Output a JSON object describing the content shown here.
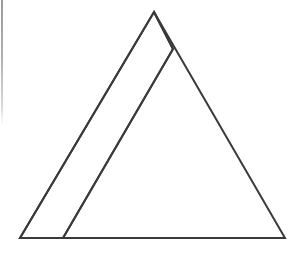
{
  "figure": {
    "canvas": {
      "width": 303,
      "height": 260,
      "background_color": "#ffffff"
    },
    "style": {
      "stroke_color": "#3a3a3a",
      "stroke_width": 2,
      "fill": "none",
      "linejoin": "miter",
      "linecap": "butt"
    },
    "shapes": [
      {
        "name": "outer-triangle",
        "type": "polygon",
        "label": "Large outline triangle",
        "points": "154,12 285,238 20,238",
        "vertices": [
          {
            "name": "apex",
            "x": 154,
            "y": 12
          },
          {
            "name": "bottom-right",
            "x": 285,
            "y": 238
          },
          {
            "name": "bottom-left",
            "x": 20,
            "y": 238
          }
        ],
        "stroke_color": "#3a3a3a",
        "stroke_width": 2,
        "fill": "none"
      },
      {
        "name": "inner-triangle",
        "type": "polygon",
        "label": "Narrow sliver triangle",
        "points": "154,12 173,49 63,238 20,238",
        "vertices": [
          {
            "name": "apex",
            "x": 154,
            "y": 12
          },
          {
            "name": "right-edge-crossing",
            "x": 173,
            "y": 49
          },
          {
            "name": "base-intersection",
            "x": 63,
            "y": 238
          },
          {
            "name": "bottom-left",
            "x": 20,
            "y": 238
          }
        ],
        "stroke_color": "#3a3a3a",
        "stroke_width": 2,
        "fill": "none"
      }
    ],
    "lines": [
      {
        "name": "inner-diagonal-line",
        "label": "Internal diagonal from apex region to base",
        "x1": 173,
        "y1": 49,
        "x2": 63,
        "y2": 238,
        "stroke_color": "#3a3a3a",
        "stroke_width": 2
      },
      {
        "name": "apex-to-crossing-segment",
        "label": "Short segment from apex down the right inner edge",
        "x1": 154,
        "y1": 12,
        "x2": 173,
        "y2": 49,
        "stroke_color": "#3a3a3a",
        "stroke_width": 2
      }
    ],
    "artifacts": [
      {
        "name": "left-edge-scan-artifact",
        "label": "Faint vertical gray scan line at left margin",
        "x": 2,
        "y_start": 0,
        "y_end": 125,
        "width": 2,
        "color": "#b8b8b8"
      }
    ]
  }
}
